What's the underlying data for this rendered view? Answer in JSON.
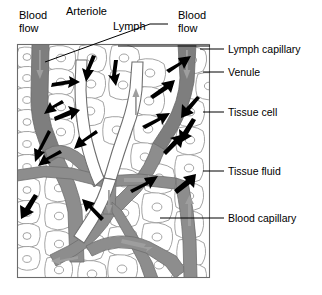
{
  "figure": {
    "frame": {
      "x": 17,
      "y": 44,
      "width": 193,
      "height": 234
    }
  },
  "labels": {
    "blood_flow_left": "Blood\nflow",
    "blood_flow_left_line1": "Blood",
    "blood_flow_left_line2": "flow",
    "arteriole": "Arteriole",
    "lymph": "Lymph",
    "blood_flow_right_line1": "Blood",
    "blood_flow_right_line2": "flow",
    "lymph_capillary": "Lymph capillary",
    "venule": "Venule",
    "tissue_cell": "Tissue cell",
    "tissue_fluid": "Tissue fluid",
    "blood_capillary": "Blood capillary"
  },
  "colors": {
    "vessel_fill": "#8d8d8d",
    "vessel_dark_fill": "#7e7e7e",
    "lymph_fill": "#ffffff",
    "cell_outline": "#9a9a9a",
    "frame_stroke": "#6b6b6b",
    "text": "#000000",
    "arrow_dark": "#000000",
    "arrow_gray": "#9e9e9e"
  },
  "structures": [
    {
      "name": "arteriole",
      "kind": "blood-vessel",
      "flow": "downward",
      "shade": "dark-gray"
    },
    {
      "name": "venule",
      "kind": "blood-vessel",
      "flow": "downward",
      "shade": "dark-gray"
    },
    {
      "name": "blood-capillary",
      "kind": "blood-vessel",
      "shade": "gray"
    },
    {
      "name": "lymph-capillary",
      "kind": "lymph-vessel",
      "flow": "upward",
      "shade": "white"
    },
    {
      "name": "tissue-cell",
      "kind": "cell",
      "shade": "white-outline"
    },
    {
      "name": "tissue-fluid",
      "kind": "space",
      "shade": "white"
    }
  ],
  "annotations": {
    "left_callouts": [
      {
        "text": "Blood\nflow",
        "target": "arteriole"
      },
      {
        "text": "Arteriole",
        "target": "arteriole"
      }
    ],
    "top_callouts": [
      {
        "text": "Lymph",
        "target": "lymph-capillary"
      },
      {
        "text": "Blood\nflow",
        "target": "venule"
      }
    ],
    "right_callouts": [
      {
        "text": "Lymph capillary",
        "y": 49
      },
      {
        "text": "Venule",
        "y": 72
      },
      {
        "text": "Tissue cell",
        "y": 112
      },
      {
        "text": "Tissue fluid",
        "y": 171
      },
      {
        "text": "Blood capillary",
        "y": 218
      }
    ]
  }
}
